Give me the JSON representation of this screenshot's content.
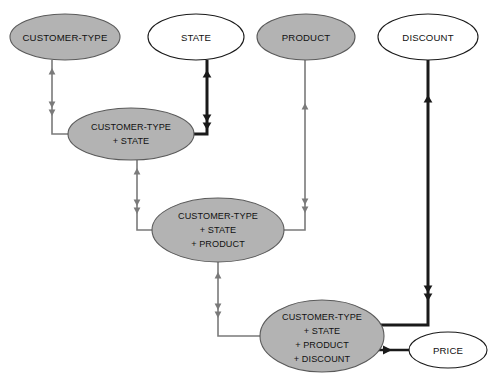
{
  "diagram": {
    "canvas": {
      "width": 493,
      "height": 376,
      "background": "#ffffff"
    },
    "palette": {
      "fill_gray": "#b3b3b3",
      "fill_white": "#ffffff",
      "stroke_dark": "#1a1a1a",
      "stroke_gray": "#6e6e6e",
      "edge_light": "#7a7a7a",
      "edge_bold": "#1a1a1a",
      "text": "#111111"
    },
    "nodes": [
      {
        "id": "customer-type",
        "label": "CUSTOMER-TYPE",
        "lines": [
          "CUSTOMER-TYPE"
        ],
        "fill": "gray",
        "cx": 65,
        "cy": 37,
        "rx": 55,
        "ry": 23
      },
      {
        "id": "state",
        "label": "STATE",
        "lines": [
          "STATE"
        ],
        "fill": "white",
        "cx": 196,
        "cy": 37,
        "rx": 48,
        "ry": 23
      },
      {
        "id": "product",
        "label": "PRODUCT",
        "lines": [
          "PRODUCT"
        ],
        "fill": "gray",
        "cx": 306,
        "cy": 37,
        "rx": 49,
        "ry": 23
      },
      {
        "id": "discount",
        "label": "DISCOUNT",
        "lines": [
          "DISCOUNT"
        ],
        "fill": "white",
        "cx": 428,
        "cy": 37,
        "rx": 50,
        "ry": 23
      },
      {
        "id": "customer-type-state",
        "label": "CUSTOMER-TYPE + STATE",
        "lines": [
          "CUSTOMER-TYPE",
          "+ STATE"
        ],
        "fill": "gray",
        "cx": 131,
        "cy": 134,
        "rx": 63,
        "ry": 26
      },
      {
        "id": "customer-type-state-product",
        "label": "CUSTOMER-TYPE + STATE + PRODUCT",
        "lines": [
          "CUSTOMER-TYPE",
          "+ STATE",
          "+ PRODUCT"
        ],
        "fill": "gray",
        "cx": 218,
        "cy": 230,
        "rx": 66,
        "ry": 32
      },
      {
        "id": "customer-type-state-product-discount",
        "label": "CUSTOMER-TYPE + STATE + PRODUCT + DISCOUNT",
        "lines": [
          "CUSTOMER-TYPE",
          "+ STATE",
          "+ PRODUCT",
          "+ DISCOUNT"
        ],
        "fill": "gray",
        "cx": 322,
        "cy": 336,
        "rx": 62,
        "ry": 36
      },
      {
        "id": "price",
        "label": "PRICE",
        "lines": [
          "PRICE"
        ],
        "fill": "white",
        "cx": 448,
        "cy": 350,
        "rx": 39,
        "ry": 18
      }
    ],
    "edges": [
      {
        "id": "edge-customer-type-to-cts",
        "from": "customer-type",
        "to": "customer-type-state",
        "weight": "light"
      },
      {
        "id": "edge-state-to-cts",
        "from": "state",
        "to": "customer-type-state",
        "weight": "bold"
      },
      {
        "id": "edge-cts-to-ctsp",
        "from": "customer-type-state",
        "to": "customer-type-state-product",
        "weight": "light"
      },
      {
        "id": "edge-product-to-ctsp",
        "from": "product",
        "to": "customer-type-state-product",
        "weight": "light"
      },
      {
        "id": "edge-ctsp-to-ctspd",
        "from": "customer-type-state-product",
        "to": "customer-type-state-product-discount",
        "weight": "light"
      },
      {
        "id": "edge-discount-to-ctspd",
        "from": "discount",
        "to": "customer-type-state-product-discount",
        "weight": "bold"
      },
      {
        "id": "edge-ctspd-to-price",
        "from": "customer-type-state-product-discount",
        "to": "price",
        "weight": "bold"
      }
    ]
  }
}
